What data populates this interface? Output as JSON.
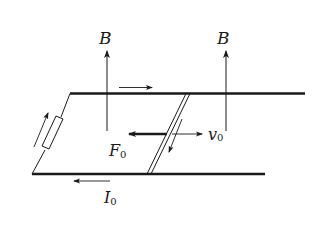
{
  "diagram": {
    "labels": {
      "field_left": "B",
      "field_right": "B",
      "force": "F",
      "force_sub": "0",
      "velocity": "v",
      "velocity_sub": "0",
      "current": "I",
      "current_sub": "0"
    },
    "colors": {
      "stroke": "#1a1a1a",
      "background": "#ffffff"
    }
  }
}
